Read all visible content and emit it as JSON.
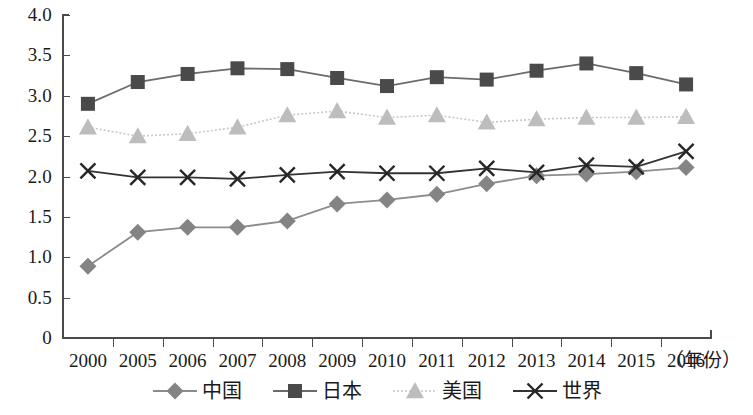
{
  "chart_data": {
    "type": "line",
    "title": "",
    "subtitle": "",
    "xlabel": "（年份）",
    "ylabel": "",
    "categories": [
      "2000",
      "2005",
      "2006",
      "2007",
      "2008",
      "2009",
      "2010",
      "2011",
      "2012",
      "2013",
      "2014",
      "2015",
      "2016"
    ],
    "x_tick_labels": [
      "2000",
      "2005",
      "2006",
      "2007",
      "2008",
      "2009",
      "2010",
      "2011",
      "2012",
      "2013",
      "2014",
      "2015",
      "2016"
    ],
    "y_tick_labels": [
      "4.0",
      "3.5",
      "3.0",
      "2.5",
      "2.0",
      "1.5",
      "1.0",
      "0.5",
      "0"
    ],
    "y_tick_values": [
      4.0,
      3.5,
      3.0,
      2.5,
      2.0,
      1.5,
      1.0,
      0.5,
      0
    ],
    "ylim": [
      0,
      4.0
    ],
    "grid": false,
    "legend_position": "bottom",
    "series": [
      {
        "name": "中国",
        "marker": "diamond",
        "line_style": "solid",
        "color": "#8c8c8c",
        "marker_color": "#848484",
        "values": [
          0.89,
          1.31,
          1.37,
          1.37,
          1.45,
          1.66,
          1.71,
          1.78,
          1.91,
          2.01,
          2.03,
          2.06,
          2.11
        ]
      },
      {
        "name": "日本",
        "marker": "square",
        "line_style": "solid",
        "color": "#6b6b6b",
        "marker_color": "#4a4a4a",
        "values": [
          2.9,
          3.17,
          3.27,
          3.34,
          3.33,
          3.22,
          3.12,
          3.23,
          3.2,
          3.31,
          3.4,
          3.28,
          3.14
        ]
      },
      {
        "name": "美国",
        "marker": "triangle",
        "line_style": "dotted",
        "color": "#c8c8c8",
        "marker_color": "#bdbdbd",
        "values": [
          2.61,
          2.5,
          2.53,
          2.61,
          2.76,
          2.81,
          2.73,
          2.76,
          2.67,
          2.71,
          2.73,
          2.73,
          2.74
        ]
      },
      {
        "name": "世界",
        "marker": "cross",
        "line_style": "solid",
        "color": "#333333",
        "marker_color": "#262626",
        "values": [
          2.07,
          1.99,
          1.99,
          1.97,
          2.02,
          2.06,
          2.04,
          2.04,
          2.1,
          2.05,
          2.14,
          2.12,
          2.31
        ]
      }
    ]
  },
  "legend": {
    "items": [
      {
        "label": "中国",
        "marker": "diamond-marker-icon"
      },
      {
        "label": "日本",
        "marker": "square-marker-icon"
      },
      {
        "label": "美国",
        "marker": "triangle-marker-icon"
      },
      {
        "label": "世界",
        "marker": "cross-marker-icon"
      }
    ]
  },
  "axes": {
    "x_axis_title": "（年份）"
  },
  "colors": {
    "axis": "#4a4a4a",
    "text": "#1a1a1a",
    "background": "#ffffff",
    "china": "#8c8c8c",
    "japan": "#4a4a4a",
    "usa": "#c8c8c8",
    "world": "#262626"
  }
}
